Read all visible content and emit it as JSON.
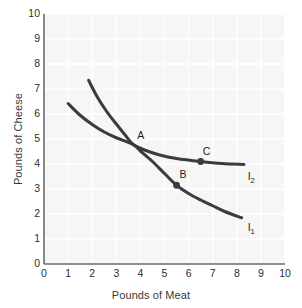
{
  "chart_data": {
    "type": "line",
    "title": "",
    "xlabel": "Pounds of Meat",
    "ylabel": "Pounds of Cheese",
    "xlim": [
      0,
      10
    ],
    "ylim": [
      0,
      10
    ],
    "xticks": [
      "0",
      "1",
      "2",
      "3",
      "4",
      "5",
      "6",
      "7",
      "8",
      "9",
      "10"
    ],
    "yticks": [
      "0",
      "1",
      "2",
      "3",
      "4",
      "5",
      "6",
      "7",
      "8",
      "9",
      "10"
    ],
    "grid": true,
    "legend_position": "inline-curve-end",
    "plot_background_color": "#f6f6f6",
    "gridline_color": "#ffffff",
    "curve_color": "#3b3b3b",
    "axis_color": "#6b6b6b",
    "series": [
      {
        "name": "I1",
        "label": "I",
        "label_subscript": "1",
        "label_x": 8.45,
        "label_y": 1.45,
        "points": [
          {
            "x": 1.0,
            "y": 6.42
          },
          {
            "x": 1.5,
            "y": 5.95
          },
          {
            "x": 2.0,
            "y": 5.58
          },
          {
            "x": 2.5,
            "y": 5.28
          },
          {
            "x": 3.0,
            "y": 5.05
          },
          {
            "x": 3.7,
            "y": 4.78
          },
          {
            "x": 4.0,
            "y": 4.52
          },
          {
            "x": 4.5,
            "y": 4.1
          },
          {
            "x": 5.0,
            "y": 3.62
          },
          {
            "x": 5.5,
            "y": 3.15
          },
          {
            "x": 6.0,
            "y": 2.82
          },
          {
            "x": 6.5,
            "y": 2.56
          },
          {
            "x": 7.0,
            "y": 2.33
          },
          {
            "x": 7.5,
            "y": 2.1
          },
          {
            "x": 8.2,
            "y": 1.85
          }
        ]
      },
      {
        "name": "I2",
        "label": "I",
        "label_subscript": "2",
        "label_x": 8.45,
        "label_y": 3.5,
        "points": [
          {
            "x": 1.85,
            "y": 7.35
          },
          {
            "x": 2.2,
            "y": 6.7
          },
          {
            "x": 2.6,
            "y": 6.1
          },
          {
            "x": 3.0,
            "y": 5.6
          },
          {
            "x": 3.4,
            "y": 5.12
          },
          {
            "x": 3.7,
            "y": 4.78
          },
          {
            "x": 4.2,
            "y": 4.55
          },
          {
            "x": 4.8,
            "y": 4.36
          },
          {
            "x": 5.5,
            "y": 4.22
          },
          {
            "x": 6.5,
            "y": 4.1
          },
          {
            "x": 7.4,
            "y": 4.02
          },
          {
            "x": 8.3,
            "y": 3.98
          }
        ]
      }
    ],
    "annotated_points": [
      {
        "id": "A",
        "label": "A",
        "x": 3.7,
        "y": 4.78,
        "marker": false,
        "label_dx": 4,
        "label_dy": -16
      },
      {
        "id": "B",
        "label": "B",
        "x": 5.5,
        "y": 3.15,
        "marker": true,
        "label_dx": 3,
        "label_dy": -17
      },
      {
        "id": "C",
        "label": "C",
        "x": 6.5,
        "y": 4.1,
        "marker": true,
        "label_dx": 2,
        "label_dy": -17
      }
    ]
  }
}
